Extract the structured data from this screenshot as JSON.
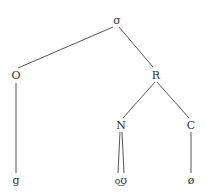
{
  "diagram": {
    "type": "syllable-tree",
    "nodes": {
      "root": {
        "label": "σ",
        "x": 117,
        "y": 24
      },
      "onset": {
        "label": "O",
        "x": 16,
        "y": 79
      },
      "rhyme": {
        "label": "R",
        "x": 156,
        "y": 79
      },
      "nucleus": {
        "label": "N",
        "x": 121,
        "y": 129
      },
      "coda": {
        "label": "C",
        "x": 191,
        "y": 129
      },
      "leaf_g": {
        "label": "g",
        "x": 16,
        "y": 184
      },
      "leaf_ou": {
        "label": "o͜ʊ",
        "x": 121,
        "y": 184
      },
      "leaf_null": {
        "label": "ø",
        "x": 191,
        "y": 184
      }
    },
    "edges": [
      {
        "from": "root",
        "to": "onset"
      },
      {
        "from": "root",
        "to": "rhyme"
      },
      {
        "from": "onset",
        "to": "leaf_g"
      },
      {
        "from": "rhyme",
        "to": "nucleus"
      },
      {
        "from": "rhyme",
        "to": "coda"
      },
      {
        "from": "nucleus",
        "to": "leaf_ou",
        "note": "two branches"
      },
      {
        "from": "coda",
        "to": "leaf_null"
      }
    ]
  }
}
